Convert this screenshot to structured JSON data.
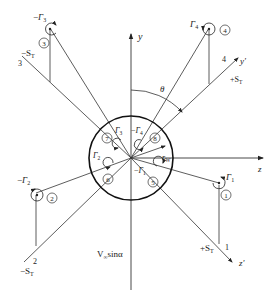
{
  "diagram": {
    "axes": {
      "y": "y",
      "z": "z",
      "y_prime": "y'",
      "z_prime": "z'"
    },
    "angle_label": "θ",
    "radius_label": "r",
    "radius_sub": "W",
    "freestream_label": "V",
    "freestream_sub": "∞",
    "freestream_suffix": "sinα",
    "vortices": [
      {
        "id": "1",
        "circled": "1",
        "label": "Γ",
        "sub": "1",
        "sign": ""
      },
      {
        "id": "2",
        "circled": "2",
        "label": "Γ",
        "sub": "2",
        "sign": "−"
      },
      {
        "id": "3",
        "circled": "3",
        "label": "Γ",
        "sub": "3",
        "sign": "−"
      },
      {
        "id": "4",
        "circled": "4",
        "label": "Γ",
        "sub": "4",
        "sign": ""
      },
      {
        "id": "5",
        "circled": "5",
        "label": "Γ",
        "sub": "1",
        "sign": "−"
      },
      {
        "id": "6",
        "circled": "6",
        "label": "Γ",
        "sub": "2",
        "sign": ""
      },
      {
        "id": "7",
        "circled": "7",
        "label": "Γ",
        "sub": "3",
        "sign": ""
      },
      {
        "id": "8",
        "circled": "8",
        "label": "Γ",
        "sub": "4",
        "sign": "−"
      }
    ],
    "span_labels": [
      {
        "id": "1",
        "number": "1",
        "s": "+S",
        "sub": "T"
      },
      {
        "id": "2",
        "number": "2",
        "s": "−S",
        "sub": "T"
      },
      {
        "id": "3",
        "number": "3",
        "s": "−S",
        "sub": "T"
      },
      {
        "id": "4",
        "number": "4",
        "s": "+S",
        "sub": "T"
      }
    ]
  }
}
